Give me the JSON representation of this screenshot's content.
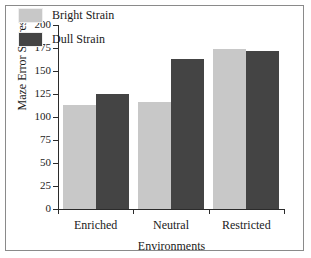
{
  "chart_data": {
    "type": "bar",
    "title": "",
    "xlabel": "Environments",
    "ylabel": "Maze Error Scores",
    "categories": [
      "Enriched",
      "Neutral",
      "Restricted"
    ],
    "series": [
      {
        "name": "Bright Strain",
        "color": "#c8c8c8",
        "values": [
          113,
          116,
          174
        ]
      },
      {
        "name": "Dull Strain",
        "color": "#444444",
        "values": [
          125,
          163,
          172
        ]
      }
    ],
    "ylim": [
      0,
      200
    ],
    "yticks": [
      0,
      25,
      50,
      75,
      100,
      125,
      150,
      175,
      200
    ],
    "ytick_labels": [
      "0",
      "25",
      "50",
      "75",
      "100",
      "125",
      "150",
      "175",
      "200"
    ],
    "grid": false,
    "legend_position": "upper-left-inside"
  },
  "legend": {
    "entries": [
      {
        "label": "Bright Strain",
        "color": "#c8c8c8"
      },
      {
        "label": "Dull Strain",
        "color": "#444444"
      }
    ]
  },
  "colors": {
    "bright": "#c8c8c8",
    "dull": "#444444",
    "axis": "#2b2b2b",
    "border": "#8a8a8a",
    "background": "#ffffff",
    "text": "#1a1a1a"
  }
}
